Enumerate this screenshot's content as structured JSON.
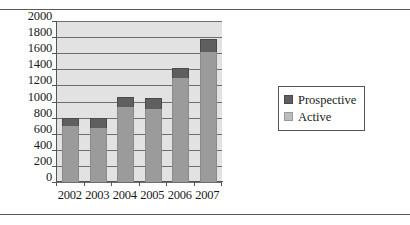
{
  "chart_data": {
    "type": "bar",
    "subtype": "stacked-bar",
    "title": "",
    "xlabel": "",
    "ylabel": "",
    "categories": [
      "2002",
      "2003",
      "2004",
      "2005",
      "2006",
      "2007"
    ],
    "series": [
      {
        "name": "Active",
        "color": "#9b9b9b",
        "values": [
          700,
          670,
          930,
          910,
          1290,
          1620
        ]
      },
      {
        "name": "Prospective",
        "color": "#5f5f5f",
        "values": [
          100,
          130,
          130,
          130,
          130,
          160
        ]
      }
    ],
    "totals": [
      800,
      800,
      1060,
      1040,
      1420,
      1780
    ],
    "ylim": [
      0,
      2000
    ],
    "ytick_step": 200,
    "yticks": [
      "2000",
      "1800",
      "1600",
      "1400",
      "1200",
      "1000",
      "800",
      "600",
      "400",
      "200",
      "0"
    ],
    "grid": true,
    "legend_position": "right",
    "plot_background": "#e2e2e2"
  },
  "legend": {
    "entries": [
      {
        "label": "Prospective",
        "swatch": "prospective-swatch"
      },
      {
        "label": "Active",
        "swatch": "active-swatch"
      }
    ]
  }
}
